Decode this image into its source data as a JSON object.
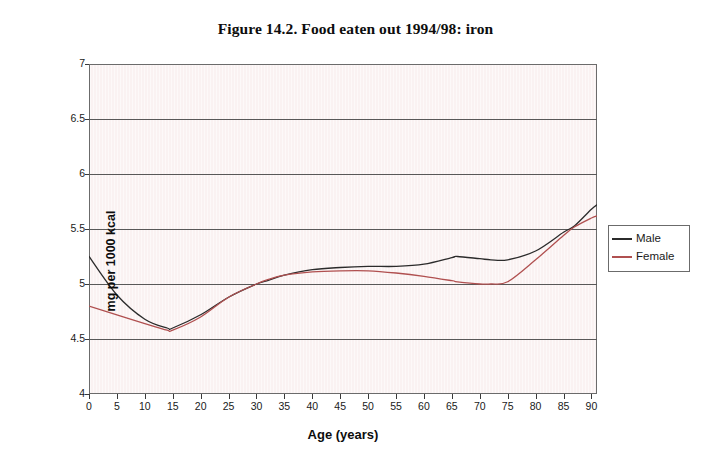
{
  "chart_data": {
    "type": "line",
    "title": "Figure 14.2. Food eaten out 1994/98: iron",
    "xlabel": "Age (years)",
    "ylabel": "mg per 1000 kcal",
    "xlim": [
      0,
      91
    ],
    "ylim": [
      4,
      7
    ],
    "grid": "horizontal",
    "legend_position": "right",
    "xticks": [
      0,
      5,
      10,
      15,
      20,
      25,
      30,
      35,
      40,
      45,
      50,
      55,
      60,
      65,
      70,
      75,
      80,
      85,
      90
    ],
    "yticks": [
      4,
      4.5,
      5,
      5.5,
      6,
      6.5,
      7
    ],
    "ytick_labels": [
      "4",
      "4.5",
      "5",
      "5.5",
      "6",
      "6.5",
      "7"
    ],
    "xtick_labels": [
      "0",
      "5",
      "10",
      "15",
      "20",
      "25",
      "30",
      "35",
      "40",
      "45",
      "50",
      "55",
      "60",
      "65",
      "70",
      "75",
      "80",
      "85",
      "90"
    ],
    "x": [
      0,
      5,
      10,
      14,
      15,
      20,
      25,
      30,
      32,
      35,
      40,
      45,
      50,
      55,
      60,
      65,
      66,
      70,
      72,
      75,
      80,
      85,
      87,
      90,
      91
    ],
    "series": [
      {
        "name": "Male",
        "color": "#2b2b2b",
        "values": [
          5.25,
          4.9,
          4.68,
          4.6,
          4.6,
          4.72,
          4.88,
          5.0,
          5.03,
          5.08,
          5.13,
          5.15,
          5.16,
          5.16,
          5.18,
          5.24,
          5.25,
          5.23,
          5.22,
          5.22,
          5.3,
          5.47,
          5.53,
          5.68,
          5.72
        ]
      },
      {
        "name": "Female",
        "color": "#b05050",
        "values": [
          4.8,
          4.72,
          4.64,
          4.58,
          4.58,
          4.7,
          4.88,
          5.0,
          5.04,
          5.08,
          5.11,
          5.12,
          5.12,
          5.1,
          5.07,
          5.03,
          5.02,
          5.0,
          5.0,
          5.02,
          5.22,
          5.44,
          5.52,
          5.6,
          5.62
        ]
      }
    ]
  },
  "legend": {
    "items": [
      {
        "label": "Male"
      },
      {
        "label": "Female"
      }
    ]
  },
  "colors": {
    "male": "#2b2b2b",
    "female": "#b05050",
    "plot_background": "#faf2f2",
    "gridline": "#585858",
    "axis": "#6b6b6b",
    "text": "#1a1a1a"
  }
}
